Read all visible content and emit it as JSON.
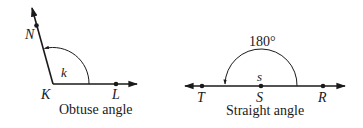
{
  "diagrams": [
    {
      "caption": "Obtuse angle",
      "vertex_label": "K",
      "points": {
        "upper_ray": "N",
        "lower_ray": "L"
      },
      "angle_label": "k"
    },
    {
      "caption": "Straight angle",
      "vertex_label": "S",
      "points": {
        "left_ray": "T",
        "right_ray": "R"
      },
      "angle_label": "s",
      "measure": "180°"
    }
  ],
  "colors": {
    "stroke": "#1a1a1a",
    "background": "#ffffff"
  }
}
